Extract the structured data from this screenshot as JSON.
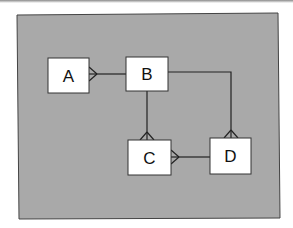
{
  "diagram": {
    "type": "entity-relationship",
    "notation": "crow's foot",
    "background_color": "#a9a9a9",
    "entities": [
      {
        "id": "A",
        "label": "A"
      },
      {
        "id": "B",
        "label": "B"
      },
      {
        "id": "C",
        "label": "C"
      },
      {
        "id": "D",
        "label": "D"
      }
    ],
    "relationships": [
      {
        "from": "B",
        "to": "A",
        "many_end": "A"
      },
      {
        "from": "B",
        "to": "C",
        "many_end": "C"
      },
      {
        "from": "B",
        "to": "D",
        "many_end": "D"
      },
      {
        "from": "D",
        "to": "C",
        "many_end": "C"
      }
    ]
  }
}
